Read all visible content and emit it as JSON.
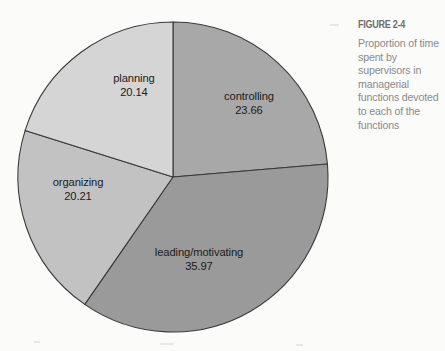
{
  "figure": {
    "caption_title": "FIGURE 2-4",
    "caption_body": "Proportion of time spent by supervisors in managerial functions devoted to each of the functions"
  },
  "chart_data": {
    "type": "pie",
    "title": "Proportion of time spent by supervisors in managerial functions devoted to each of the functions",
    "categories": [
      "controlling",
      "leading/motivating",
      "organizing",
      "planning"
    ],
    "values": [
      23.66,
      35.97,
      20.21,
      20.14
    ],
    "value_labels": [
      "23.66",
      "20.14",
      "20.21",
      "35.97"
    ],
    "units": "percent",
    "start_angle_deg": 0,
    "direction": "clockwise",
    "legend": "none",
    "labels_position": "inside-slices",
    "slices": [
      {
        "name": "controlling",
        "label": "controlling",
        "value": 23.66,
        "value_text": "23.66",
        "color": "#a8a8a8",
        "label_x": 249,
        "label_y": 100,
        "value_x": 249,
        "value_y": 114
      },
      {
        "name": "leading/motivating",
        "label": "leading/motivating",
        "value": 35.97,
        "value_text": "35.97",
        "color": "#9a9a9a",
        "label_x": 199,
        "label_y": 256,
        "value_x": 199,
        "value_y": 270
      },
      {
        "name": "organizing",
        "label": "organizing",
        "value": 20.21,
        "value_text": "20.21",
        "color": "#c2c2c2",
        "label_x": 78,
        "label_y": 186,
        "value_x": 78,
        "value_y": 200
      },
      {
        "name": "planning",
        "label": "planning",
        "value": 20.14,
        "value_text": "20.14",
        "color": "#d5d5d5",
        "label_x": 134,
        "label_y": 82,
        "value_x": 134,
        "value_y": 96
      }
    ],
    "geometry": {
      "center_x": 173,
      "center_y": 177,
      "radius": 155
    },
    "stroke_color": "#3a3a3a",
    "background": "#fbfbfa"
  }
}
